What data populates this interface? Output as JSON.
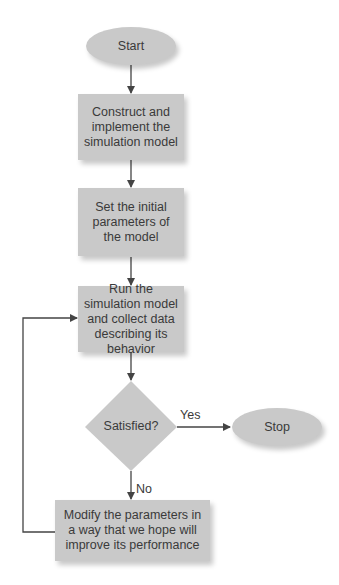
{
  "flowchart": {
    "start": {
      "label": "Start"
    },
    "step1": {
      "label": "Construct and implement the simulation model"
    },
    "step2": {
      "label": "Set the initial parameters of the model"
    },
    "step3": {
      "label": "Run the simulation model and collect data describing its behavior"
    },
    "decision": {
      "label": "Satisfied?"
    },
    "stop": {
      "label": "Stop"
    },
    "step4": {
      "label": "Modify the parameters in a way that we hope will improve its performance"
    },
    "edges": {
      "yes_label": "Yes",
      "no_label": "No"
    },
    "colors": {
      "node_fill": "#c9c9c9",
      "line": "#444444",
      "text": "#3a3a3a"
    }
  }
}
